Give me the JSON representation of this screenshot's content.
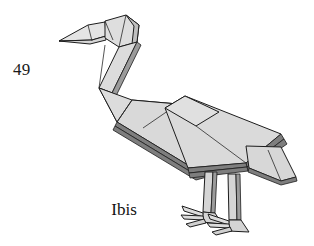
{
  "page": {
    "number": "49",
    "background_color": "#ffffff",
    "width": 314,
    "height": 246
  },
  "figure": {
    "caption": "Ibis",
    "style": "shaded line drawing",
    "colors": {
      "paper_light": "#e2e2e2",
      "paper_mid": "#d2d2d2",
      "paper_shadow": "#bcbcbc",
      "edge_dark": "#7e7e7e",
      "outline": "#1c1c1c",
      "text": "#111111"
    },
    "parts": [
      "beak",
      "head",
      "neck",
      "breast",
      "body",
      "wing",
      "tail",
      "front-leg",
      "back-leg",
      "front-foot",
      "back-foot"
    ]
  }
}
